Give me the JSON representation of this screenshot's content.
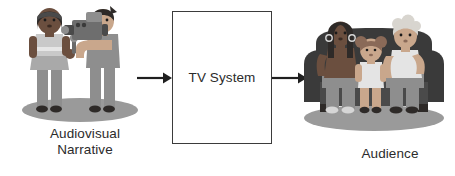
{
  "diagram": {
    "background_color": "#ffffff",
    "text_color": "#2b2b2b",
    "nodes": [
      {
        "id": "audiovisual-narrative",
        "label": "Audiovisual\nNarrative",
        "type": "illustration",
        "illustration": "reporter-and-cameraman"
      },
      {
        "id": "tv-system",
        "label": "TV System",
        "type": "process-box",
        "border_color": "#3b3b3b",
        "fill_color": "#ffffff"
      },
      {
        "id": "audience",
        "label": "Audience",
        "type": "illustration",
        "illustration": "family-on-couch"
      }
    ],
    "arrows": [
      {
        "id": "arrow-left",
        "from": "audiovisual-narrative",
        "to": "tv-system",
        "direction": "right",
        "color": "#1f1f1f"
      },
      {
        "id": "arrow-right",
        "from": "tv-system",
        "to": "audience",
        "direction": "right",
        "color": "#1f1f1f"
      }
    ]
  },
  "labels": {
    "left": "Audiovisual\nNarrative",
    "box": "TV System",
    "right": "Audience"
  },
  "colors": {
    "line": "#3b3b3b",
    "arrow": "#1f1f1f",
    "shadow": "#9a9a9a",
    "skin_dark": "#6b4f3f",
    "skin_light": "#c9a78c",
    "hair_dark": "#2e2a28",
    "hair_gray": "#d8d5cf",
    "clothes_gray": "#8e8e8e",
    "clothes_light": "#d6d6d6",
    "couch_dark": "#3a3a3a",
    "couch_mid": "#6e6e6e"
  },
  "illustrations": {
    "left": {
      "name": "reporter-and-cameraman",
      "parts": [
        "reporter-with-microphone",
        "cameraman-with-video-camera",
        "ground-shadow"
      ]
    },
    "right": {
      "name": "family-on-couch",
      "parts": [
        "woman",
        "child",
        "elder",
        "couch",
        "ground-shadow"
      ]
    }
  }
}
